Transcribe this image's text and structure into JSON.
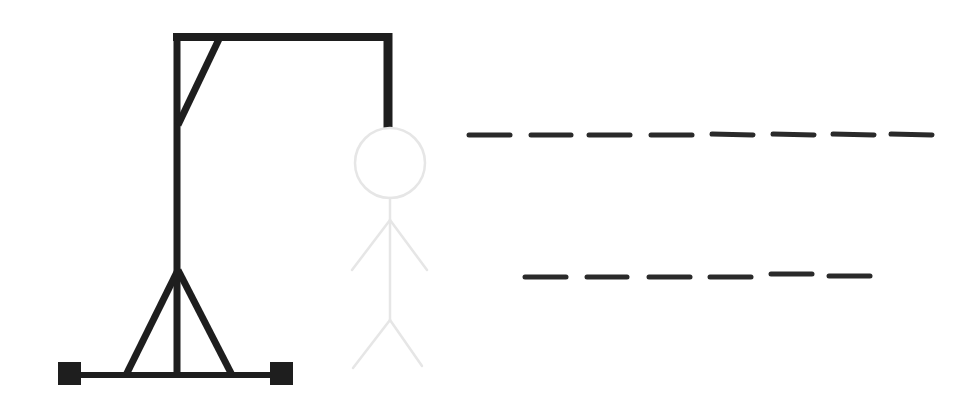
{
  "game": {
    "type": "hangman",
    "colors": {
      "background": "#ffffff",
      "gallows": "#1e1e1e",
      "figure_outline": "#e6e6e6",
      "dash": "#2a2a2a"
    },
    "gallows": {
      "parts": [
        "base",
        "left-foot",
        "right-foot",
        "tripod-left",
        "tripod-right",
        "post",
        "top-beam",
        "brace",
        "rope"
      ]
    },
    "figure": {
      "parts": [
        "head",
        "body",
        "left-arm",
        "right-arm",
        "left-leg",
        "right-leg"
      ],
      "state": "faded"
    },
    "word_rows": [
      {
        "row": 1,
        "letter_count": 8,
        "letters": [
          "",
          "",
          "",
          "",
          "",
          "",
          "",
          ""
        ]
      },
      {
        "row": 2,
        "letter_count": 6,
        "letters": [
          "",
          "",
          "",
          "",
          "",
          ""
        ]
      }
    ]
  }
}
